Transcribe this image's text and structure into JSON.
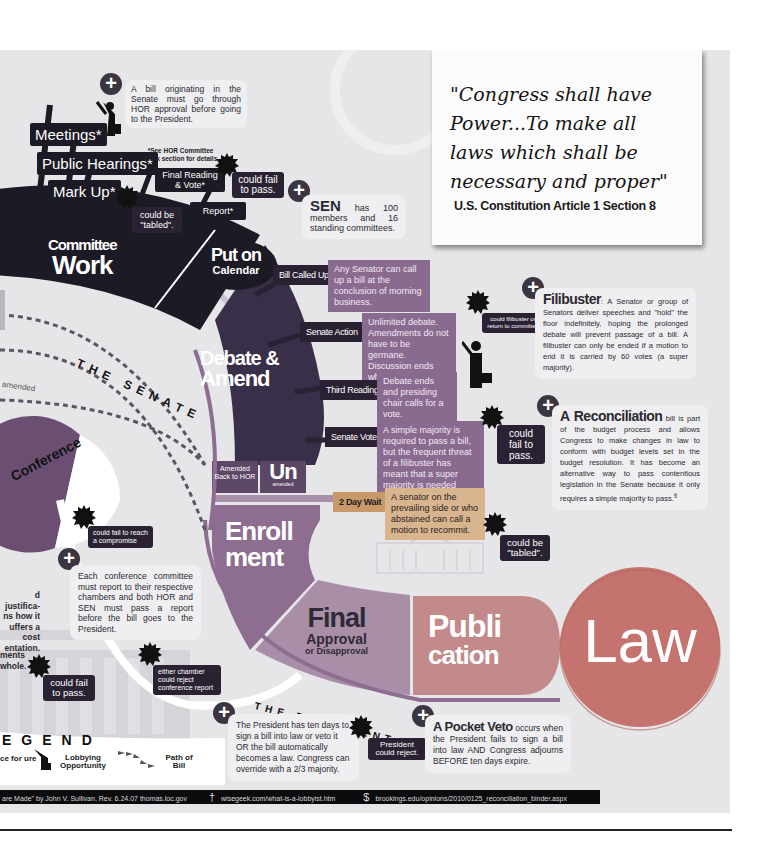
{
  "quote": {
    "text": "\"Congress shall have Power...To make all laws which shall be necessary and proper\"",
    "line1": "\"Congress shall have",
    "line2": "Power...To make all",
    "line3": "laws which shall be",
    "line4": "necessary and proper\"",
    "source": "U.S. Constitution Article 1 Section 8"
  },
  "committee": {
    "steps": [
      "Meetings*",
      "Public Hearings*",
      "Mark Up*",
      "Final Reading & Vote*",
      "Report*"
    ],
    "footnote": "*See HOR Committee Work section for details",
    "title_small": "Committee",
    "title_big": "Work",
    "tabled": "could be \"tabled\".",
    "fail": "could fail to pass."
  },
  "senate_origin_note": "A bill originating in the Senate must go through HOR approval before going to the President.",
  "sen_note": {
    "title": "SEN",
    "text": "has 100 members and 16 standing committees."
  },
  "calendar": {
    "line1": "Put on",
    "line2": "Calendar"
  },
  "senate_arc_label": "THE SENATE",
  "president_arc_label": "THE PRESIDENT",
  "debate": {
    "title1": "Debate &",
    "title2": "Amend",
    "steps": [
      {
        "label": "Bill Called Up",
        "desc": "Any Senator can call up a bill at the conclusion of morning business."
      },
      {
        "label": "Senate Action",
        "desc": "Unlimited debate. Amendments do not have to be germane. Discussion ends when no one seeks to be recognized."
      },
      {
        "label": "Third Reading",
        "desc": "Debate ends and presiding chair calls for a vote."
      },
      {
        "label": "Senate Vote",
        "desc": "A simple majority is required to pass a bill, but the frequent threat of a filibuster has meant that a super majority is needed more often."
      },
      {
        "label": "2 Day Wait",
        "desc": "A senator on the prevailing side or who abstained can call a motion to recommit."
      }
    ],
    "filibuster_risk": "could filibuster or return to committee",
    "vote_fail": "could fail to pass.",
    "tabled": "could be \"tabled\"."
  },
  "filibuster": {
    "title": "Filibuster",
    "text": ": A Senator or group of Senators deliver speeches and \"hold\" the floor indefinitely, hoping the prolonged debate will prevent passage of a bill. A filibuster can only be ended if a motion to end it is carried by 60 votes (a super majority)."
  },
  "reconciliation": {
    "title": "A Reconciliation",
    "text": "bill is part of the budget process and allows Congress to make changes in law to conform with budget levels set in the budget resolution. It has become an alternative way to pass contentious legislation in the Senate because it only requires a simple majority to pass.",
    "sup": "§"
  },
  "amended": {
    "back": "Amended Back to HOR",
    "un_big": "Un",
    "un_small": "amended",
    "arrow_label": "amended"
  },
  "conference": {
    "title": "Conference",
    "fail": "could fail to reach a compromise",
    "note": "Each conference committee must report to their respective chambers and both HOR and SEN must pass a report before the bill goes to the President.",
    "reject": "either chamber could reject conference report"
  },
  "left_fragments": {
    "frag1": "d justifica- ns how it uffers a cost entation.",
    "frag2": "ments whole.",
    "fail": "could fail to pass."
  },
  "enrollment": {
    "line1": "Enroll",
    "line2": "ment"
  },
  "final": {
    "big": "Final",
    "mid": "Approval",
    "small": "or Disapproval"
  },
  "publication": {
    "line1": "Publi",
    "line2": "cation"
  },
  "law": "Law",
  "president_note": "The President has ten days to sign a bill into law or veto it OR the bill automatically becomes a law. Congress can override with a 2/3 majority.",
  "president_reject": "President could reject.",
  "pocket_veto": {
    "title": "A Pocket Veto",
    "text": "occurs when the President fails to sign a bill into law AND Congress adjourns BEFORE ten days expire."
  },
  "legend": {
    "title": "EGEND",
    "items": [
      {
        "icon": "chance-for-failure-icon",
        "label": "ce for ure"
      },
      {
        "icon": "lobbyist-icon",
        "label": "Lobbying Opportunity"
      },
      {
        "icon": "path-arrows-icon",
        "label": "Path of Bill"
      }
    ]
  },
  "footer": {
    "source1": "are Made\" by John V. Sullivan. Rev. 6.24.07 thomas.loc.gov",
    "source2": "wisegeek.com/what-is-a-lobbyist.htm",
    "source3": "brookings.edu/opinions/2010/0125_reconciliation_binder.aspx",
    "mark2": "†",
    "mark3": "$"
  },
  "colors": {
    "background": "#e6e5e8",
    "committee": "#1c1a24",
    "debate": "#3a2f48",
    "desc_box": "#8a6b90",
    "enrollment": "#8d6d90",
    "final": "#a98ea8",
    "publication": "#c28a8a",
    "law": "#c4736e",
    "wait_box": "#c89a6a"
  }
}
